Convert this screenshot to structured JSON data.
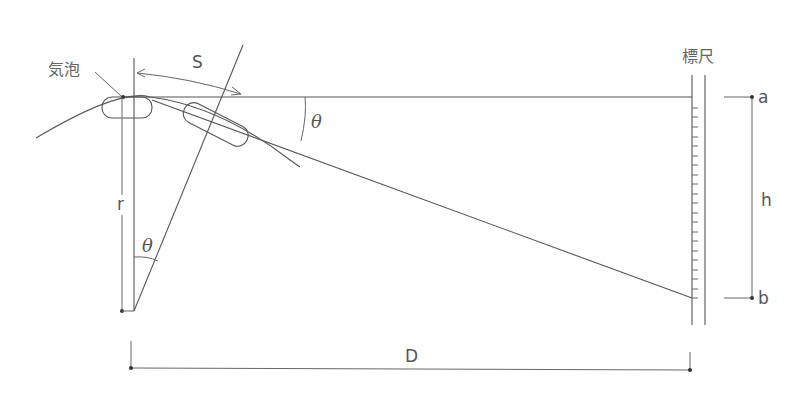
{
  "diagram": {
    "labels": {
      "bubble": "気泡",
      "staff": "標尺",
      "arc_length": "S",
      "radius": "r",
      "angle_top": "θ",
      "angle_bottom": "θ",
      "height_diff": "h",
      "point_a": "a",
      "point_b": "b",
      "distance": "D"
    },
    "colors": {
      "line": "#555555",
      "text": "#555555",
      "background": "#ffffff"
    },
    "staff_ticks": 20
  }
}
